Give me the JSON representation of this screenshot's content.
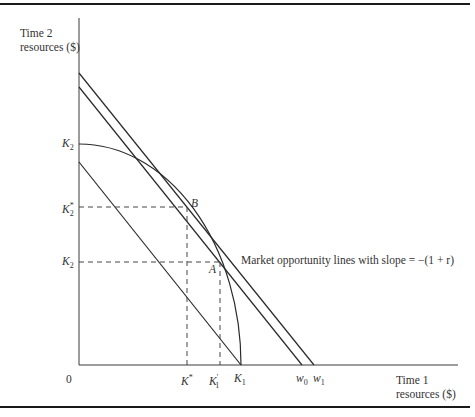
{
  "diagram": {
    "y_axis_label_line1": "Time 2",
    "y_axis_label_line2": "resources ($)",
    "x_axis_label_line1": "Time 1",
    "x_axis_label_line2": "resources ($)",
    "origin_label": "0",
    "annotation": "Market opportunity lines with slope = −(1 + r)",
    "points": {
      "B": "B",
      "A": "A"
    },
    "y_ticks": [
      {
        "base": "K",
        "sub": "2",
        "sup": ""
      },
      {
        "base": "K",
        "sub": "2",
        "sup": "*"
      },
      {
        "base": "K",
        "sub": "2",
        "sup": ""
      }
    ],
    "x_ticks": [
      {
        "base": "K",
        "sub": "",
        "sup": "*"
      },
      {
        "base": "K",
        "sub": "1",
        "sup": "'"
      },
      {
        "base": "K",
        "sub": "1",
        "sup": ""
      },
      {
        "base": "w",
        "sub": "0",
        "sup": ""
      },
      {
        "base": "w",
        "sub": "1",
        "sup": ""
      }
    ],
    "colors": {
      "line": "#2a2a2a",
      "rule": "#1a1a1a",
      "text": "#333333"
    }
  }
}
